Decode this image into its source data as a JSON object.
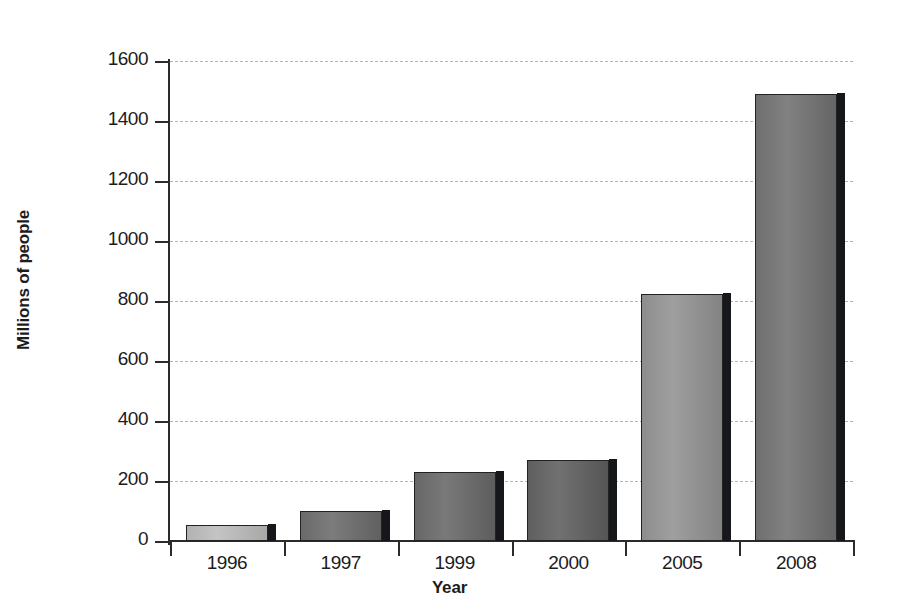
{
  "chart_data": {
    "type": "bar",
    "title": "",
    "xlabel": "Year",
    "ylabel": "Millions of people",
    "categories": [
      "1996",
      "1997",
      "1999",
      "2000",
      "2005",
      "2008"
    ],
    "values": [
      55,
      100,
      230,
      270,
      825,
      1490
    ],
    "ylim": [
      0,
      1600
    ],
    "y_ticks": [
      0,
      200,
      400,
      600,
      800,
      1000,
      1200,
      1400,
      1600
    ],
    "y_tick_labels": [
      "0",
      "200",
      "400",
      "600",
      "800",
      "1000",
      "1200",
      "1400",
      "1600"
    ],
    "grid": "horizontal-dotted",
    "legend": "none",
    "bar_colors": [
      "#b2b2b2",
      "#6a6a6a",
      "#676767",
      "#5f5f5f",
      "#8d8d8d",
      "#6f6f6f"
    ],
    "bar_shadow_color": "#16171a",
    "bar_outline_color": "#222222",
    "gridline_color": "#b4b4b4",
    "axis_color": "#2b2b2b"
  }
}
